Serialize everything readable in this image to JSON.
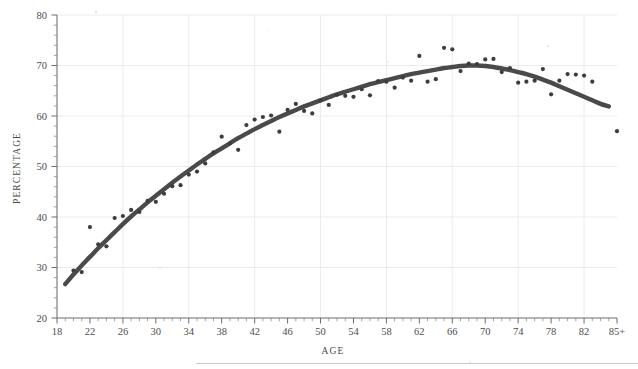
{
  "figure": {
    "background": "#ffffff",
    "ink_color": "#3d3d40",
    "curve_color": "#4a4a4c",
    "grid_color": "#e9e9ea",
    "axis_color": "#6d6d70"
  },
  "axes": {
    "x_title": "AGE",
    "y_title": "PERCENTAGE",
    "x_tick_labels": [
      "18",
      "22",
      "26",
      "30",
      "34",
      "38",
      "42",
      "46",
      "50",
      "54",
      "58",
      "62",
      "66",
      "70",
      "74",
      "78",
      "82",
      "85+"
    ],
    "y_tick_labels": [
      "20",
      "30",
      "40",
      "50",
      "60",
      "70",
      "80"
    ]
  },
  "chart_data": {
    "type": "scatter",
    "title": "",
    "subtitle": "",
    "xlabel": "AGE",
    "ylabel": "PERCENTAGE",
    "xlim": [
      18,
      86
    ],
    "ylim": [
      20,
      80
    ],
    "x_major_ticks": [
      18,
      22,
      26,
      30,
      34,
      38,
      42,
      46,
      50,
      54,
      58,
      62,
      66,
      70,
      74,
      78,
      82,
      86
    ],
    "x_tick_labels": [
      "18",
      "22",
      "26",
      "30",
      "34",
      "38",
      "42",
      "46",
      "50",
      "54",
      "58",
      "62",
      "66",
      "70",
      "74",
      "78",
      "82",
      "85+"
    ],
    "x_minor_tick_step": 1,
    "y_major_ticks": [
      20,
      30,
      40,
      50,
      60,
      70,
      80
    ],
    "y_minor_tick_step": 2,
    "gridlines": {
      "vertical_at": [
        26,
        34,
        42,
        50,
        58,
        66,
        74,
        82
      ],
      "horizontal_at": [
        30,
        40,
        50,
        60,
        70,
        80
      ]
    },
    "legend": null,
    "series": [
      {
        "name": "observed",
        "kind": "scatter",
        "marker": "filled-circle",
        "points": [
          [
            20,
            29.4
          ],
          [
            21,
            29.1
          ],
          [
            22,
            38.0
          ],
          [
            23,
            34.6
          ],
          [
            24,
            34.2
          ],
          [
            25,
            39.8
          ],
          [
            26,
            40.2
          ],
          [
            27,
            41.4
          ],
          [
            28,
            41.0
          ],
          [
            29,
            43.2
          ],
          [
            30,
            43.0
          ],
          [
            31,
            44.6
          ],
          [
            32,
            46.1
          ],
          [
            33,
            46.3
          ],
          [
            34,
            48.4
          ],
          [
            35,
            49.0
          ],
          [
            36,
            50.6
          ],
          [
            37,
            52.8
          ],
          [
            38,
            55.9
          ],
          [
            39,
            54.6
          ],
          [
            40,
            53.3
          ],
          [
            41,
            58.2
          ],
          [
            42,
            59.3
          ],
          [
            43,
            59.8
          ],
          [
            44,
            60.1
          ],
          [
            45,
            56.9
          ],
          [
            46,
            61.2
          ],
          [
            47,
            62.4
          ],
          [
            48,
            61.0
          ],
          [
            49,
            60.5
          ],
          [
            50,
            63.1
          ],
          [
            51,
            62.2
          ],
          [
            52,
            64.2
          ],
          [
            53,
            64.0
          ],
          [
            54,
            63.8
          ],
          [
            55,
            65.3
          ],
          [
            56,
            64.1
          ],
          [
            57,
            66.9
          ],
          [
            58,
            66.8
          ],
          [
            59,
            65.6
          ],
          [
            60,
            67.6
          ],
          [
            61,
            67.0
          ],
          [
            62,
            71.9
          ],
          [
            63,
            66.8
          ],
          [
            64,
            67.3
          ],
          [
            65,
            73.5
          ],
          [
            66,
            73.2
          ],
          [
            67,
            68.9
          ],
          [
            68,
            70.4
          ],
          [
            69,
            70.3
          ],
          [
            70,
            71.2
          ],
          [
            71,
            71.3
          ],
          [
            72,
            68.7
          ],
          [
            73,
            69.5
          ],
          [
            74,
            66.6
          ],
          [
            75,
            66.8
          ],
          [
            76,
            67.0
          ],
          [
            77,
            69.3
          ],
          [
            78,
            64.3
          ],
          [
            79,
            67.0
          ],
          [
            80,
            68.3
          ],
          [
            81,
            68.2
          ],
          [
            82,
            68.0
          ],
          [
            83,
            66.8
          ],
          [
            86,
            57.0
          ]
        ]
      },
      {
        "name": "fitted trend",
        "kind": "smooth-line",
        "points": [
          [
            19.0,
            26.7
          ],
          [
            20.0,
            28.6
          ],
          [
            21.0,
            30.4
          ],
          [
            22.0,
            32.1
          ],
          [
            23.0,
            33.8
          ],
          [
            24.0,
            35.4
          ],
          [
            25.0,
            37.0
          ],
          [
            26.0,
            38.6
          ],
          [
            27.0,
            40.1
          ],
          [
            28.0,
            41.5
          ],
          [
            29.0,
            42.9
          ],
          [
            30.0,
            44.2
          ],
          [
            31.0,
            45.5
          ],
          [
            32.0,
            46.8
          ],
          [
            33.0,
            48.0
          ],
          [
            34.0,
            49.2
          ],
          [
            35.0,
            50.4
          ],
          [
            36.0,
            51.5
          ],
          [
            37.0,
            52.6
          ],
          [
            38.0,
            53.6
          ],
          [
            39.0,
            54.6
          ],
          [
            40.0,
            55.6
          ],
          [
            41.0,
            56.5
          ],
          [
            42.0,
            57.4
          ],
          [
            43.0,
            58.2
          ],
          [
            44.0,
            59.0
          ],
          [
            45.0,
            59.8
          ],
          [
            46.0,
            60.5
          ],
          [
            47.0,
            61.2
          ],
          [
            48.0,
            61.9
          ],
          [
            49.0,
            62.5
          ],
          [
            50.0,
            63.1
          ],
          [
            51.0,
            63.7
          ],
          [
            52.0,
            64.3
          ],
          [
            53.0,
            64.8
          ],
          [
            54.0,
            65.3
          ],
          [
            55.0,
            65.8
          ],
          [
            56.0,
            66.3
          ],
          [
            57.0,
            66.7
          ],
          [
            58.0,
            67.1
          ],
          [
            59.0,
            67.5
          ],
          [
            60.0,
            67.9
          ],
          [
            61.0,
            68.3
          ],
          [
            62.0,
            68.6
          ],
          [
            63.0,
            68.9
          ],
          [
            64.0,
            69.2
          ],
          [
            65.0,
            69.5
          ],
          [
            66.0,
            69.7
          ],
          [
            67.0,
            69.9
          ],
          [
            68.0,
            70.0
          ],
          [
            69.0,
            70.0
          ],
          [
            70.0,
            69.9
          ],
          [
            71.0,
            69.7
          ],
          [
            72.0,
            69.4
          ],
          [
            73.0,
            69.1
          ],
          [
            74.0,
            68.7
          ],
          [
            75.0,
            68.3
          ],
          [
            76.0,
            67.8
          ],
          [
            77.0,
            67.2
          ],
          [
            78.0,
            66.6
          ],
          [
            79.0,
            65.9
          ],
          [
            80.0,
            65.2
          ],
          [
            81.0,
            64.5
          ],
          [
            82.0,
            63.8
          ],
          [
            83.0,
            63.1
          ],
          [
            84.0,
            62.4
          ],
          [
            85.0,
            61.9
          ]
        ]
      }
    ]
  }
}
